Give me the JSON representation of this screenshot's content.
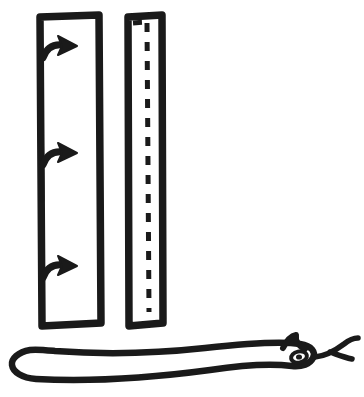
{
  "canvas": {
    "width": 364,
    "height": 397,
    "background_color": "#ffffff",
    "ink_color": "#1a1a1a",
    "style": "hand-drawn black ink line art, no text labels"
  },
  "figure": {
    "title": "",
    "elements": [
      {
        "id": "left-strip",
        "name": "left-strip-with-arrows",
        "shape": "tall vertical rectangle outline",
        "fill": "none",
        "stroke_color": "#1a1a1a",
        "stroke_width": 7,
        "bounds": {
          "x": 38,
          "y": 15,
          "width": 62,
          "height": 311
        },
        "contents": "three curved right-pointing arrows emerging from the left edge"
      },
      {
        "id": "right-strip",
        "name": "right-strip-with-dashed-line",
        "shape": "tall narrow vertical rectangle outline",
        "fill": "none",
        "stroke_color": "#1a1a1a",
        "stroke_width": 7,
        "bounds": {
          "x": 127,
          "y": 15,
          "width": 36,
          "height": 311
        },
        "contents": "dashed fold line running down the interior, with a short horizontal dashed segment at the top"
      },
      {
        "id": "snake",
        "name": "snake-figure",
        "shape": "long horizontal snake outline with head at right",
        "fill": "none",
        "stroke_color": "#1a1a1a",
        "stroke_width": 6,
        "bounds": {
          "x": 10,
          "y": 334,
          "width": 348,
          "height": 54
        },
        "features": [
          "rounded tail loop at left",
          "eye",
          "pointed horn above head",
          "forked tongue at right"
        ]
      }
    ]
  },
  "left_strip": {
    "arrows": [
      {
        "name": "arrow-1",
        "index": 1,
        "y": 50,
        "direction": "right",
        "style": "curved hook arrow"
      },
      {
        "name": "arrow-2",
        "index": 2,
        "y": 157,
        "direction": "right",
        "style": "curved hook arrow"
      },
      {
        "name": "arrow-3",
        "index": 3,
        "y": 270,
        "direction": "right",
        "style": "curved hook arrow"
      }
    ],
    "arrow_count": 3
  },
  "right_strip": {
    "dash_line": {
      "name": "dashed-fold-line",
      "orientation": "vertical",
      "x": 146,
      "y_start": 24,
      "y_end": 312,
      "dash_pattern": "9 10",
      "stroke_width": 5,
      "top_segment": {
        "orientation": "horizontal",
        "x_start": 133,
        "x_end": 146,
        "y": 22
      }
    }
  },
  "snake": {
    "head": {
      "name": "snake-head",
      "cx": 300,
      "cy": 355,
      "eye": {
        "name": "snake-eye",
        "cx": 299,
        "cy": 357,
        "rx": 7,
        "ry": 5
      },
      "horn": {
        "name": "snake-horn",
        "tip_x": 295,
        "tip_y": 336
      },
      "tongue": {
        "name": "snake-tongue",
        "forked": true,
        "tip_upper": [
          357,
          340
        ],
        "tip_lower": [
          352,
          358
        ]
      }
    },
    "tail": {
      "name": "snake-tail",
      "x": 12,
      "y": 364,
      "shape": "rounded loop"
    }
  }
}
